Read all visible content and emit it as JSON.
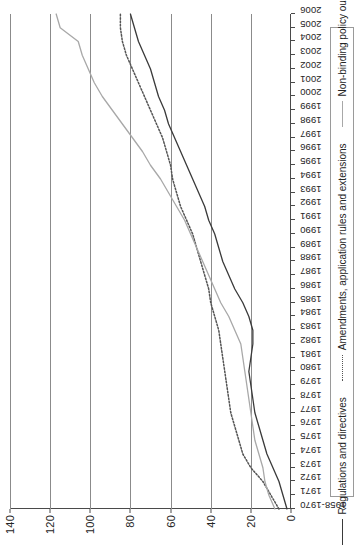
{
  "chart_data": {
    "type": "line",
    "title": "",
    "subtitle": "",
    "xlabel": "",
    "ylabel": "",
    "grid": true,
    "legend_position": "bottom",
    "ylim": [
      0,
      140
    ],
    "y_ticks": [
      0,
      20,
      40,
      60,
      80,
      100,
      120,
      140
    ],
    "categories": [
      "1958-1970",
      "1971",
      "1972",
      "1973",
      "1974",
      "1975",
      "1976",
      "1977",
      "1978",
      "1979",
      "1980",
      "1981",
      "1982",
      "1983",
      "1984",
      "1985",
      "1986",
      "1987",
      "1988",
      "1989",
      "1990",
      "1991",
      "1992",
      "1993",
      "1994",
      "1995",
      "1996",
      "1997",
      "1998",
      "1999",
      "2000",
      "2001",
      "2002",
      "2003",
      "2004",
      "2005",
      "2006"
    ],
    "series": [
      {
        "name": "Regulations and directives",
        "style": "solid",
        "color": "#3a3a3a",
        "values": [
          2,
          4,
          6,
          9,
          12,
          14,
          16,
          18,
          19,
          20,
          21,
          20,
          19,
          19,
          21,
          24,
          28,
          31,
          34,
          36,
          38,
          41,
          43,
          46,
          49,
          52,
          55,
          58,
          61,
          63,
          66,
          68,
          70,
          73,
          76,
          78,
          80
        ]
      },
      {
        "name": "Amendments, application rules and extensions",
        "style": "dotted",
        "color": "#555555",
        "values": [
          6,
          10,
          14,
          20,
          24,
          26,
          28,
          30,
          31,
          32,
          33,
          34,
          35,
          36,
          38,
          40,
          41,
          43,
          45,
          47,
          49,
          52,
          55,
          57,
          59,
          60,
          62,
          64,
          67,
          70,
          73,
          76,
          79,
          82,
          84,
          85,
          85
        ]
      },
      {
        "name": "Non-binding policy outputs",
        "style": "solid",
        "color": "#a8a8a8",
        "values": [
          8,
          11,
          13,
          14,
          16,
          18,
          19,
          20,
          21,
          22,
          23,
          24,
          25,
          28,
          31,
          35,
          38,
          41,
          44,
          47,
          50,
          53,
          57,
          61,
          65,
          70,
          74,
          79,
          84,
          89,
          94,
          98,
          101,
          104,
          106,
          115,
          117
        ]
      }
    ]
  },
  "legend": {
    "items": [
      {
        "label": "Regulations and directives",
        "swatch": "solid-dark-line-icon"
      },
      {
        "label": "Amendments, application rules and extensions",
        "swatch": "dotted-line-icon"
      },
      {
        "label": "Non-binding policy outputs",
        "swatch": "solid-gray-line-icon"
      }
    ]
  },
  "colors": {
    "regulations": "#3a3a3a",
    "amendments": "#555555",
    "nonbinding": "#a8a8a8",
    "gridline": "#8b8b8b",
    "axis": "#4a4a4a",
    "background": "#ffffff"
  }
}
